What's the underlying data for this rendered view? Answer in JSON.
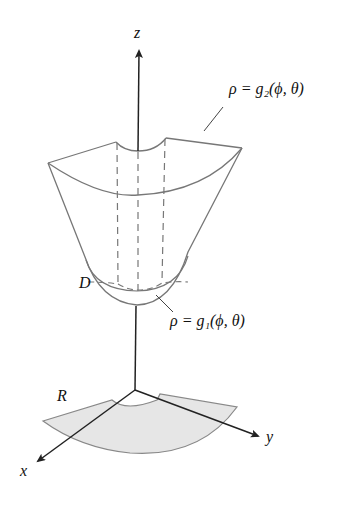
{
  "diagram": {
    "type": "spherical-coordinates-solid-region",
    "axes": {
      "z_label": "z",
      "x_label": "x",
      "y_label": "y"
    },
    "labels": {
      "upper_surface": "ρ = g₂(ϕ, θ)",
      "lower_surface": "ρ = g₁(ϕ, θ)",
      "solid": "D",
      "projection_region": "R"
    },
    "colors": {
      "line": "#777777",
      "axis": "#222222",
      "region_fill": "#e6e6e6"
    }
  }
}
